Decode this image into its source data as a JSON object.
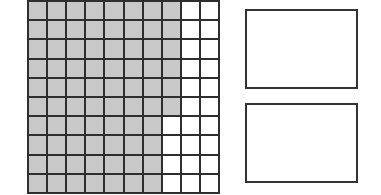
{
  "diagram": {
    "type": "hundred-grid",
    "rows": 10,
    "columns": 10,
    "shaded_per_row": [
      8,
      8,
      8,
      8,
      8,
      8,
      7,
      7,
      7,
      7
    ],
    "total_cells": 100,
    "shaded_total": 76,
    "colors": {
      "shaded": "#c8c8c8",
      "unshaded": "#ffffff",
      "gridline": "#2e2e2e"
    }
  },
  "answer_boxes": [
    {
      "label": "",
      "value": ""
    },
    {
      "label": "",
      "value": ""
    }
  ]
}
